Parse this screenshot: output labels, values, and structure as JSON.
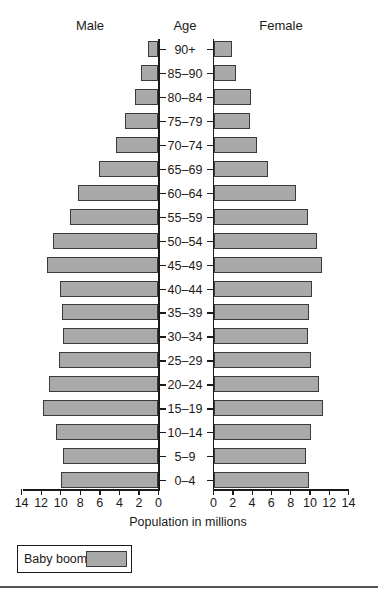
{
  "chart_data": {
    "type": "bar",
    "subtype": "population-pyramid",
    "orientation": "horizontal",
    "title": "",
    "headers": {
      "left": "Male",
      "center": "Age",
      "right": "Female"
    },
    "xlabel": "Population in millions",
    "ylabel": "Age",
    "xlim": [
      0,
      14
    ],
    "x_ticks": [
      0,
      2,
      4,
      6,
      8,
      10,
      12,
      14
    ],
    "grid": false,
    "categories": [
      "90+",
      "85–90",
      "80–84",
      "75–79",
      "70–74",
      "65–69",
      "60–64",
      "55–59",
      "50–54",
      "45–49",
      "40–44",
      "35–39",
      "30–34",
      "25–29",
      "20–24",
      "15–19",
      "10–14",
      "5–9",
      "0–4"
    ],
    "series": [
      {
        "name": "Male",
        "values": [
          1.1,
          1.8,
          2.4,
          3.4,
          4.3,
          6.1,
          8.2,
          9.0,
          10.8,
          11.4,
          10.1,
          9.9,
          9.8,
          10.2,
          11.2,
          11.8,
          10.5,
          9.8,
          10.0
        ]
      },
      {
        "name": "Female",
        "values": [
          1.9,
          2.3,
          3.9,
          3.8,
          4.5,
          5.7,
          8.6,
          9.8,
          10.7,
          11.3,
          10.2,
          9.9,
          9.8,
          10.1,
          10.9,
          11.4,
          10.1,
          9.6,
          9.9
        ]
      }
    ],
    "legend": {
      "entries": [
        "Baby boom"
      ],
      "position": "bottom-left"
    },
    "colors": {
      "bar_fill": "#a9a9a9",
      "bar_border": "#3a3a3a",
      "axis": "#1a1a1a"
    }
  }
}
